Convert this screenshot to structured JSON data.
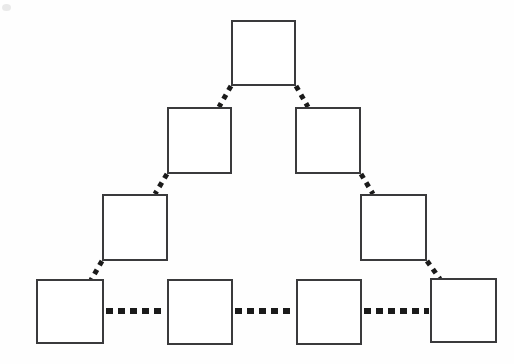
{
  "diagram": {
    "type": "tree-pyramid",
    "background_color": "#fefefe",
    "node_fill_color": "#ffffff",
    "node_border_color": "#3a3a3c",
    "connector_color": "#1a1a1a",
    "node_border_width": 2,
    "levels": 4,
    "node_count": 9,
    "connector_count": 9,
    "nodes": [
      {
        "id": "n1",
        "label": "",
        "level": 1,
        "x": 231,
        "y": 20,
        "w": 65,
        "h": 66
      },
      {
        "id": "n2",
        "label": "",
        "level": 2,
        "x": 167,
        "y": 107,
        "w": 65,
        "h": 67
      },
      {
        "id": "n3",
        "label": "",
        "level": 2,
        "x": 295,
        "y": 107,
        "w": 66,
        "h": 67
      },
      {
        "id": "n4",
        "label": "",
        "level": 3,
        "x": 102,
        "y": 194,
        "w": 66,
        "h": 67
      },
      {
        "id": "n5",
        "label": "",
        "level": 3,
        "x": 360,
        "y": 194,
        "w": 67,
        "h": 67
      },
      {
        "id": "n6",
        "label": "",
        "level": 4,
        "x": 36,
        "y": 279,
        "w": 68,
        "h": 65
      },
      {
        "id": "n7",
        "label": "",
        "level": 4,
        "x": 167,
        "y": 279,
        "w": 66,
        "h": 66
      },
      {
        "id": "n8",
        "label": "",
        "level": 4,
        "x": 296,
        "y": 279,
        "w": 66,
        "h": 66
      },
      {
        "id": "n9",
        "label": "",
        "level": 4,
        "x": 430,
        "y": 278,
        "w": 67,
        "h": 65
      }
    ],
    "connectors": [
      {
        "id": "c1",
        "from": "n1",
        "to": "n2",
        "style": "dashed-diagonal",
        "x1": 231,
        "y1": 86,
        "x2": 219,
        "y2": 107
      },
      {
        "id": "c2",
        "from": "n1",
        "to": "n3",
        "style": "dashed-diagonal",
        "x1": 296,
        "y1": 86,
        "x2": 308,
        "y2": 107
      },
      {
        "id": "c3",
        "from": "n2",
        "to": "n4",
        "style": "dashed-diagonal",
        "x1": 167,
        "y1": 174,
        "x2": 155,
        "y2": 194
      },
      {
        "id": "c4",
        "from": "n3",
        "to": "n5",
        "style": "dashed-diagonal",
        "x1": 361,
        "y1": 174,
        "x2": 373,
        "y2": 194
      },
      {
        "id": "c5",
        "from": "n4",
        "to": "n6",
        "style": "dashed-diagonal",
        "x1": 102,
        "y1": 261,
        "x2": 91,
        "y2": 280
      },
      {
        "id": "c6",
        "from": "n5",
        "to": "n9",
        "style": "dashed-diagonal",
        "x1": 427,
        "y1": 261,
        "x2": 440,
        "y2": 279
      },
      {
        "id": "c7",
        "from": "n6",
        "to": "n7",
        "style": "dashed-horizontal",
        "x1": 106,
        "y1": 311,
        "x2": 166,
        "y2": 311
      },
      {
        "id": "c8",
        "from": "n7",
        "to": "n8",
        "style": "dashed-horizontal",
        "x1": 235,
        "y1": 311,
        "x2": 295,
        "y2": 311
      },
      {
        "id": "c9",
        "from": "n8",
        "to": "n9",
        "style": "dashed-horizontal",
        "x1": 364,
        "y1": 311,
        "x2": 429,
        "y2": 311
      }
    ]
  }
}
